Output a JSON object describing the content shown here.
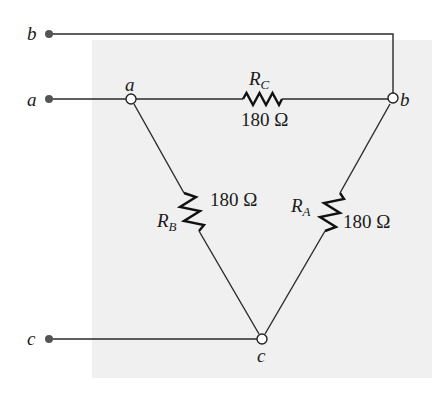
{
  "diagram": {
    "type": "delta-resistor-network",
    "background_panel_color": "#f0f0f0",
    "terminals": [
      {
        "id": "b",
        "label": "b"
      },
      {
        "id": "a",
        "label": "a"
      },
      {
        "id": "c",
        "label": "c"
      }
    ],
    "nodes": [
      {
        "id": "a",
        "label": "a"
      },
      {
        "id": "b",
        "label": "b"
      },
      {
        "id": "c",
        "label": "c"
      }
    ],
    "resistors": [
      {
        "id": "RC",
        "name": "R",
        "subscript": "C",
        "value": "180 Ω",
        "between": [
          "a",
          "b"
        ]
      },
      {
        "id": "RB",
        "name": "R",
        "subscript": "B",
        "value": "180 Ω",
        "between": [
          "a",
          "c"
        ]
      },
      {
        "id": "RA",
        "name": "R",
        "subscript": "A",
        "value": "180 Ω",
        "between": [
          "b",
          "c"
        ]
      }
    ]
  }
}
